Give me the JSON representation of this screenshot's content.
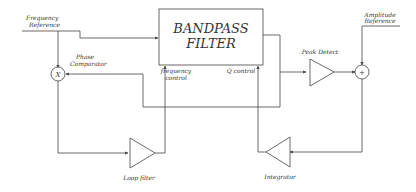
{
  "diagram": {
    "type": "block-diagram",
    "blocks": {
      "bandpass_filter": {
        "line1": "BANDPASS",
        "line2": "FILTER"
      },
      "phase_comparator": {
        "symbol": "X",
        "label_line1": "Phase",
        "label_line2": "Comparator"
      },
      "summing_junction": {
        "symbol": "+"
      },
      "peak_detect": {
        "label": "Peak Detect"
      },
      "loop_filter": {
        "label": "Loop filter"
      },
      "integrator": {
        "label": "Integrator"
      }
    },
    "inputs": {
      "frequency_reference": {
        "line1": "Frequency",
        "line2": "Reference"
      },
      "amplitude_reference": {
        "line1": "Amplitude",
        "line2": "Reference"
      }
    },
    "control_ports": {
      "frequency_control": {
        "line1": "frequency",
        "line2": "control"
      },
      "q_control": {
        "label": "Q control"
      }
    }
  }
}
